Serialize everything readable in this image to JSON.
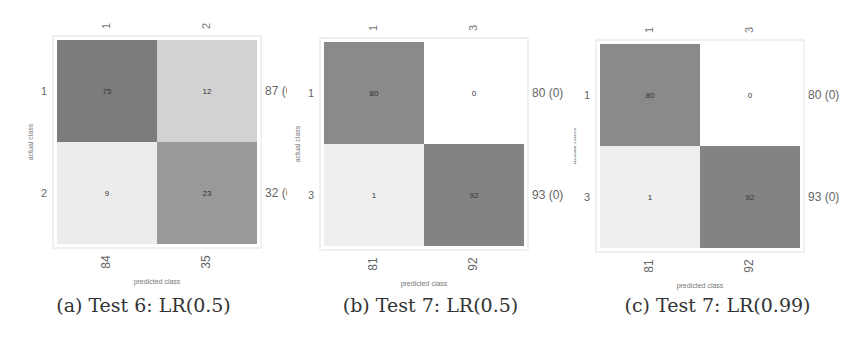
{
  "chart_data": [
    {
      "type": "heatmap",
      "title": "(a) Test 6: LR(0.5)",
      "xlabel": "predicted class",
      "ylabel": "actual class",
      "col_labels": [
        "1",
        "2"
      ],
      "row_labels": [
        "1",
        "2"
      ],
      "matrix": [
        [
          75,
          12
        ],
        [
          9,
          23
        ]
      ],
      "row_totals": [
        "87 (0)",
        "32 (0)"
      ],
      "col_totals": [
        "84",
        "35"
      ],
      "cell_colors": [
        [
          "#7c7c7c",
          "#d2d2d2"
        ],
        [
          "#ececec",
          "#999999"
        ]
      ]
    },
    {
      "type": "heatmap",
      "title": "(b) Test 7: LR(0.5)",
      "xlabel": "predicted class",
      "ylabel": "actual class",
      "col_labels": [
        "1",
        "3"
      ],
      "row_labels": [
        "1",
        "3"
      ],
      "matrix": [
        [
          80,
          0
        ],
        [
          1,
          92
        ]
      ],
      "row_totals": [
        "80 (0)",
        "93 (0)"
      ],
      "col_totals": [
        "81",
        "92"
      ],
      "cell_colors": [
        [
          "#8a8a8a",
          "#ffffff"
        ],
        [
          "#eeeeee",
          "#838383"
        ]
      ]
    },
    {
      "type": "heatmap",
      "title": "(c) Test 7: LR(0.99)",
      "xlabel": "predicted class",
      "ylabel": "actual class",
      "col_labels": [
        "1",
        "3"
      ],
      "row_labels": [
        "1",
        "3"
      ],
      "matrix": [
        [
          80,
          0
        ],
        [
          1,
          92
        ]
      ],
      "row_totals": [
        "80 (0)",
        "93 (0)"
      ],
      "col_totals": [
        "81",
        "92"
      ],
      "cell_colors": [
        [
          "#8a8a8a",
          "#ffffff"
        ],
        [
          "#eeeeee",
          "#838383"
        ]
      ]
    }
  ],
  "captions": [
    "(a) Test 6: LR(0.5)",
    "(b) Test 7: LR(0.5)",
    "(c) Test 7: LR(0.99)"
  ]
}
